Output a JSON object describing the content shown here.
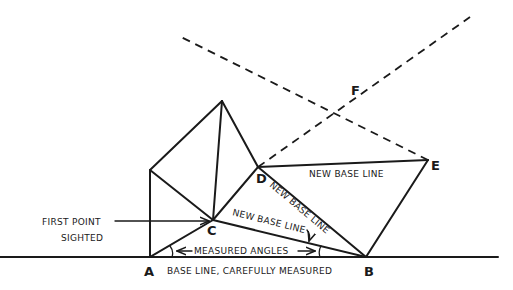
{
  "diagram": {
    "points": {
      "A": "A",
      "B": "B",
      "C": "C",
      "D": "D",
      "E": "E",
      "F": "F"
    },
    "labels": {
      "first_point": "FIRST POINT",
      "sighted": "SIGHTED",
      "measured_angles": "MEASURED ANGLES",
      "base_line": "BASE LINE, CAREFULLY MEASURED",
      "new_base_line_de": "NEW BASE LINE",
      "new_base_line_db": "NEW BASE LINE",
      "new_base_line_cb": "NEW BASE LINE"
    }
  }
}
